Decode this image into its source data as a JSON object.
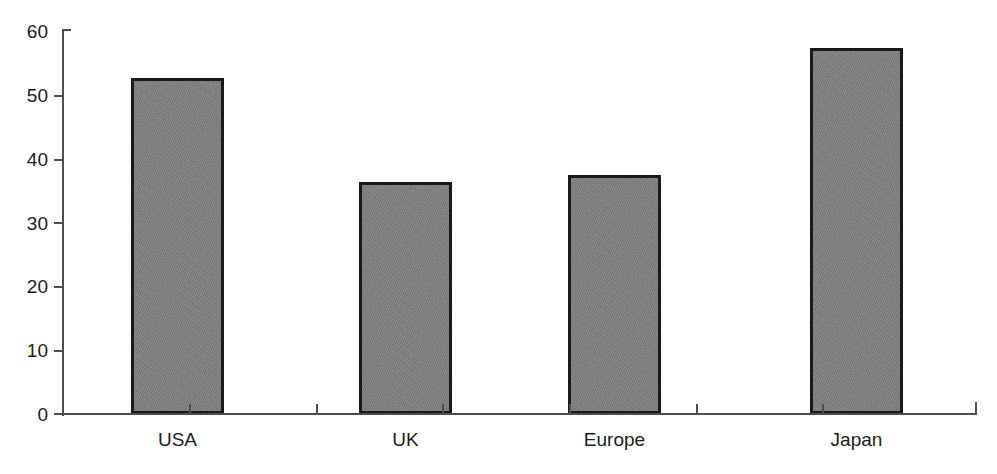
{
  "chart_data": {
    "type": "bar",
    "title": "",
    "subtitle": "",
    "xlabel": "",
    "ylabel": "",
    "categories": [
      "USA",
      "UK",
      "Europe",
      "Japan"
    ],
    "values": [
      52.7,
      36.4,
      37.5,
      57.4
    ],
    "ylim": [
      0,
      60
    ],
    "ytick_labels": [
      "0",
      "10",
      "20",
      "30",
      "40",
      "50",
      "60"
    ],
    "ytick_values": [
      0,
      10,
      20,
      30,
      40,
      50,
      60
    ],
    "grid": false,
    "legend": false,
    "legend_position": "none",
    "annotations": [],
    "bar_fill_color": "#808080",
    "bar_border_color": "#1a1a1a",
    "axis_color": "#4d4d4d",
    "text_color": "#1c1c1c",
    "background_color": "#ffffff"
  }
}
